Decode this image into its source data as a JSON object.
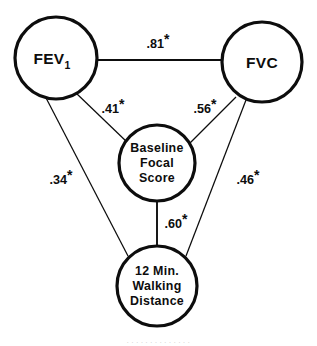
{
  "figure": {
    "type": "path-diagram",
    "background_color": "#ffffff",
    "line_color": "#0d0d0d"
  },
  "nodes": {
    "fev1": {
      "id": "fev1",
      "main_text": "FEV",
      "subscript_text": "1",
      "cx": 56,
      "cy": 58,
      "r": 41
    },
    "fvc": {
      "id": "fvc",
      "main_text": "FVC",
      "cx": 262,
      "cy": 62,
      "r": 40
    },
    "baseline_focal_score": {
      "id": "baseline-focal-score",
      "line1": "Baseline",
      "line2": "Focal",
      "line3": "Score",
      "cx": 157,
      "cy": 163,
      "r": 38
    },
    "walking_distance": {
      "id": "walking-distance",
      "line1": "12 Min.",
      "line2": "Walking",
      "line3": "Distance",
      "cx": 157,
      "cy": 286,
      "r": 40
    }
  },
  "edges": [
    {
      "id": "fev1-fvc",
      "from": "fev1",
      "to": "fvc",
      "value": ".81",
      "significance": "*",
      "label_x": 158,
      "label_y": 48,
      "x1": 97,
      "y1": 60,
      "x2": 222,
      "y2": 60
    },
    {
      "id": "fev1-baseline",
      "from": "fev1",
      "to": "baseline_focal_score",
      "value": ".41",
      "significance": "*",
      "label_x": 113,
      "label_y": 113,
      "x1": 76,
      "y1": 93,
      "x2": 128,
      "y2": 143
    },
    {
      "id": "fvc-baseline",
      "from": "fvc",
      "to": "baseline_focal_score",
      "value": ".56",
      "significance": "*",
      "label_x": 205,
      "label_y": 113,
      "x1": 236,
      "y1": 97,
      "x2": 189,
      "y2": 144
    },
    {
      "id": "fev1-walking",
      "from": "fev1",
      "to": "walking_distance",
      "value": ".34",
      "significance": "*",
      "label_x": 61,
      "label_y": 184,
      "x1": 44,
      "y1": 94,
      "x2": 128,
      "y2": 256
    },
    {
      "id": "fvc-walking",
      "from": "fvc",
      "to": "walking_distance",
      "value": ".46",
      "significance": "*",
      "label_x": 248,
      "label_y": 184,
      "x1": 246,
      "y1": 100,
      "x2": 186,
      "y2": 256
    },
    {
      "id": "baseline-walking",
      "from": "baseline_focal_score",
      "to": "walking_distance",
      "value": ".60",
      "significance": "*",
      "label_x": 176,
      "label_y": 228,
      "x1": 157,
      "y1": 201,
      "x2": 157,
      "y2": 246
    }
  ],
  "caption_fragment": ". .  . .   .  .  .   .   .   .    .  .   .  ."
}
